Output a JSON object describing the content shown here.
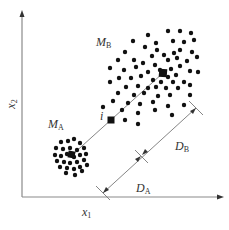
{
  "diagram": {
    "type": "cluster-distance-diagram",
    "colors": {
      "axis": "#8a8a8a",
      "line": "#777777",
      "points": "#111111",
      "text": "#333333"
    },
    "axes": {
      "x_label": {
        "base": "x",
        "sub": "1"
      },
      "y_label": {
        "base": "x",
        "sub": "2"
      }
    },
    "clusters": {
      "A": {
        "label": {
          "base": "M",
          "sub": "A"
        },
        "center": [
          72,
          155
        ]
      },
      "B": {
        "label": {
          "base": "M",
          "sub": "B"
        },
        "center": [
          163,
          73
        ]
      }
    },
    "point_i": {
      "label": "i",
      "position": [
        111,
        120
      ]
    },
    "distances": {
      "D_A": {
        "base": "D",
        "sub": "A"
      },
      "D_B": {
        "base": "D",
        "sub": "B"
      }
    }
  }
}
